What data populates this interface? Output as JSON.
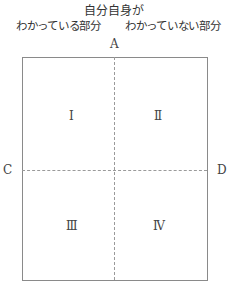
{
  "diagram": {
    "title": "自分自身が",
    "column_headers": {
      "left": "わかっている部分",
      "right": "わかっていない部分"
    },
    "axis_labels": {
      "top": "A",
      "left": "C",
      "right": "D"
    },
    "quadrants": [
      {
        "position": "top-left",
        "label": "Ⅰ"
      },
      {
        "position": "top-right",
        "label": "Ⅱ"
      },
      {
        "position": "bottom-left",
        "label": "Ⅲ"
      },
      {
        "position": "bottom-right",
        "label": "Ⅳ"
      }
    ],
    "colors": {
      "border": "#8a8a8a",
      "divider": "#9a9a9a",
      "text": "#333333"
    }
  }
}
